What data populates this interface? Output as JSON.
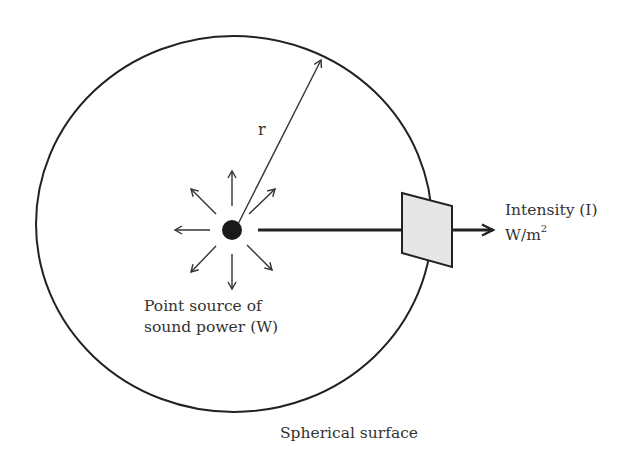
{
  "diagram": {
    "radius_label": "r",
    "source_label_line1": "Point source of",
    "source_label_line2": "sound power (W)",
    "intensity_label": "Intensity (I)",
    "intensity_unit_base": "W/m",
    "intensity_unit_exp": "2",
    "surface_label": "Spherical surface",
    "colors": {
      "stroke": "#222222",
      "patch_fill": "#e6e6e6",
      "text": "#333333"
    }
  }
}
